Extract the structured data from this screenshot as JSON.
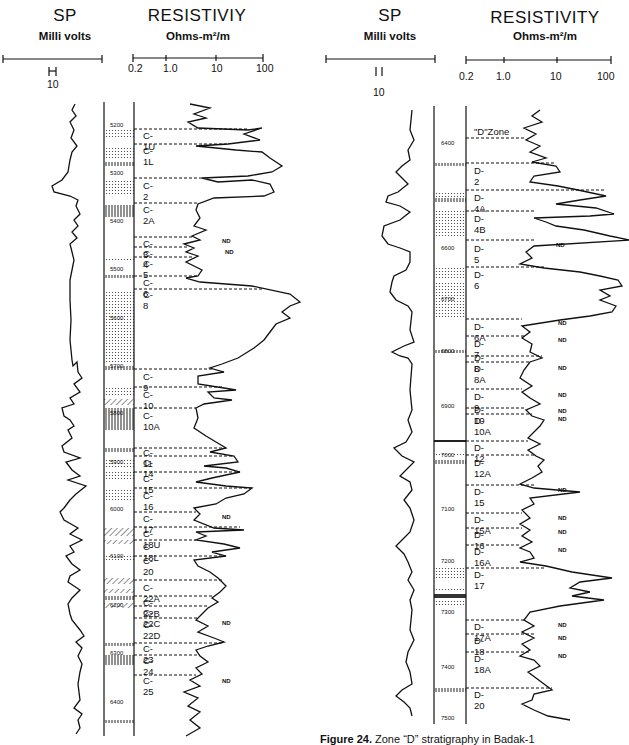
{
  "left_panel": {
    "sp": {
      "title": "SP",
      "unit": "Milli volts",
      "scale_label": "10"
    },
    "resistivity": {
      "title": "RESISTIVIY",
      "unit": "Ohms-m²/m",
      "ticks": [
        "0.2",
        "1.0",
        "10",
        "100"
      ]
    },
    "depths": [
      {
        "label": "5200",
        "y": 128
      },
      {
        "label": "5300",
        "y": 176
      },
      {
        "label": "5400",
        "y": 222
      },
      {
        "label": "5500",
        "y": 272
      },
      {
        "label": "5600",
        "y": 318
      },
      {
        "label": "5700",
        "y": 368
      },
      {
        "label": "5800",
        "y": 414
      },
      {
        "label": "5900",
        "y": 463
      },
      {
        "label": "6000",
        "y": 510
      },
      {
        "label": "6100",
        "y": 556
      },
      {
        "label": "6200",
        "y": 605
      },
      {
        "label": "6300",
        "y": 654
      },
      {
        "label": "6400",
        "y": 702
      }
    ],
    "zones": [
      {
        "label": "C-1U",
        "y": 129
      },
      {
        "label": "C-1L",
        "y": 144
      },
      {
        "label": "C-2",
        "y": 178
      },
      {
        "label": "C-2A",
        "y": 203
      },
      {
        "label": "C-3",
        "y": 237
      },
      {
        "label": "C-4",
        "y": 247
      },
      {
        "label": "C-5",
        "y": 256
      },
      {
        "label": "C-6",
        "y": 276
      },
      {
        "label": "C-8",
        "y": 289
      },
      {
        "label": "C-9",
        "y": 369
      },
      {
        "label": "C-10",
        "y": 387
      },
      {
        "label": "C-10A",
        "y": 408
      },
      {
        "label": "C-11",
        "y": 448
      },
      {
        "label": "C-14",
        "y": 456
      },
      {
        "label": "C-15",
        "y": 472
      },
      {
        "label": "C-16",
        "y": 488
      },
      {
        "label": "C-17",
        "y": 512
      },
      {
        "label": "C-18U",
        "y": 527
      },
      {
        "label": "C-18L",
        "y": 540
      },
      {
        "label": "C-20",
        "y": 556
      },
      {
        "label": "C-22A",
        "y": 580
      },
      {
        "label": "C-22B",
        "y": 596
      },
      {
        "label": "C-22C",
        "y": 606
      },
      {
        "label": "C-22D",
        "y": 618
      },
      {
        "label": "C-23",
        "y": 643
      },
      {
        "label": "C-24",
        "y": 655
      },
      {
        "label": "C-25",
        "y": 675
      }
    ],
    "nd_labels": [
      {
        "text": "ND",
        "y": 241
      },
      {
        "text": "ND",
        "y": 252
      },
      {
        "text": "ND",
        "y": 517
      },
      {
        "text": "ND",
        "y": 623
      },
      {
        "text": "ND",
        "y": 681
      }
    ]
  },
  "right_panel": {
    "sp": {
      "title": "SP",
      "unit": "Milli volts",
      "scale_label": "10"
    },
    "resistivity": {
      "title": "RESISTIVITY",
      "unit": "Ohms-m²/m",
      "ticks": [
        "0.2",
        "1.0",
        "10",
        "100"
      ]
    },
    "depths": [
      {
        "label": "6400",
        "y": 143
      },
      {
        "label": "6600",
        "y": 248
      },
      {
        "label": "6700",
        "y": 299
      },
      {
        "label": "6800",
        "y": 353
      },
      {
        "label": "6900",
        "y": 406
      },
      {
        "label": "7000",
        "y": 456
      },
      {
        "label": "7100",
        "y": 508
      },
      {
        "label": "7200",
        "y": 561
      },
      {
        "label": "7300",
        "y": 612
      },
      {
        "label": "7400",
        "y": 666
      },
      {
        "label": "7500",
        "y": 718
      }
    ],
    "zones": [
      {
        "label": "\"D\"Zone",
        "y": 132
      },
      {
        "label": "D-2",
        "y": 168
      },
      {
        "label": "D-4A",
        "y": 196
      },
      {
        "label": "D-4B",
        "y": 217
      },
      {
        "label": "D-5",
        "y": 248
      },
      {
        "label": "D-6",
        "y": 274
      },
      {
        "label": "D-6A",
        "y": 326
      },
      {
        "label": "D-7",
        "y": 342
      },
      {
        "label": "D-8",
        "y": 357
      },
      {
        "label": "D-8A",
        "y": 368
      },
      {
        "label": "D-9",
        "y": 395
      },
      {
        "label": "D-10",
        "y": 409
      },
      {
        "label": "D-10A",
        "y": 420
      },
      {
        "label": "D-12",
        "y": 446
      },
      {
        "label": "D-12A",
        "y": 462
      },
      {
        "label": "D-15",
        "y": 491
      },
      {
        "label": "D-15A",
        "y": 518
      },
      {
        "label": "D-16",
        "y": 534
      },
      {
        "label": "D-16A",
        "y": 549
      },
      {
        "label": "D-17",
        "y": 573
      },
      {
        "label": "D-17A",
        "y": 624
      },
      {
        "label": "D-18",
        "y": 638
      },
      {
        "label": "D-18A",
        "y": 656
      },
      {
        "label": "D-20",
        "y": 692
      }
    ],
    "nd_labels": [
      {
        "text": "ND",
        "y": 245
      },
      {
        "text": "ND",
        "y": 323
      },
      {
        "text": "ND",
        "y": 340
      },
      {
        "text": "ND",
        "y": 368
      },
      {
        "text": "ND",
        "y": 395
      },
      {
        "text": "ND",
        "y": 411
      },
      {
        "text": "ND",
        "y": 419
      },
      {
        "text": "ND",
        "y": 490
      },
      {
        "text": "ND",
        "y": 518
      },
      {
        "text": "ND",
        "y": 532
      },
      {
        "text": "ND",
        "y": 550
      },
      {
        "text": "ND",
        "y": 625
      },
      {
        "text": "ND",
        "y": 638
      },
      {
        "text": "ND",
        "y": 656
      }
    ]
  },
  "caption": {
    "figure": "Figure 24.",
    "text": "Zone “D” stratigraphy in Badak-1"
  }
}
